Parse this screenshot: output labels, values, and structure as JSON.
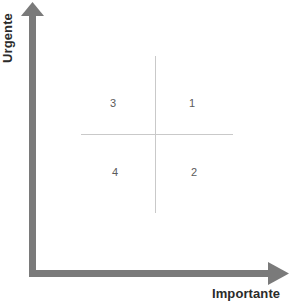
{
  "diagram": {
    "type": "quadrant-matrix",
    "background_color": "#ffffff",
    "axes": {
      "vertical": {
        "label": "Urgente",
        "icon": "up-arrow-icon",
        "color": "#7a7a7a",
        "orientation": "vertical",
        "rotation_degrees": -90
      },
      "horizontal": {
        "label": "Importante",
        "icon": "right-arrow-icon",
        "color": "#7a7a7a",
        "orientation": "horizontal"
      }
    },
    "cross": {
      "line_color": "#c9c9c9",
      "vertical_divider_name": "quadrant-divider-vertical",
      "horizontal_divider_name": "quadrant-divider-horizontal"
    },
    "quadrants": [
      {
        "id": "1",
        "label": "1",
        "position": "top-right"
      },
      {
        "id": "2",
        "label": "2",
        "position": "bottom-right"
      },
      {
        "id": "3",
        "label": "3",
        "position": "top-left"
      },
      {
        "id": "4",
        "label": "4",
        "position": "bottom-left"
      }
    ],
    "number_color": "#5b5b5b",
    "label_color": "#2b2b2b"
  }
}
